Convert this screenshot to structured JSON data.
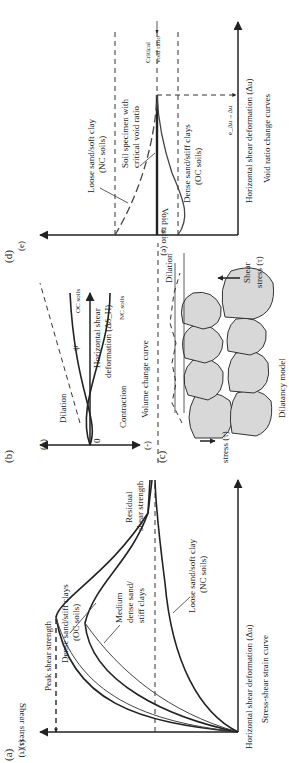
{
  "figure": {
    "orientation": "rotated 90 degrees counter-clockwise",
    "panels": {
      "a": {
        "tag": "(a)",
        "y_axis_symbol": "(τ)",
        "y_axis_label": "Shear stress (τ)",
        "x_axis_label": "Horizontal shear deformation (Δu)",
        "caption": "Stress-shear strain curve",
        "annotations": {
          "peak": "Peak shear strength",
          "dense": [
            "Dense sand/stiff clays",
            "(OC soils)"
          ],
          "medium": [
            "Medium",
            "dense sand/",
            "stiff clays"
          ],
          "loose": [
            "Loose sand/soft clay",
            "(NC soils)"
          ],
          "residual": [
            "Residual",
            "shear strength"
          ]
        }
      },
      "b": {
        "tag": "(b)",
        "plus": "(+)",
        "minus": "(-)",
        "zero": "0",
        "dilation": "Dilation",
        "contraction": "Contraction",
        "psi": "ψ",
        "oc": "OC soils",
        "nc": "NC soils",
        "x_axis_label": [
          "Horizontal shear",
          "deformation (Δδ_H)"
        ],
        "caption": "Volume change curve"
      },
      "c": {
        "tag": "(c)",
        "dilation": "Dilation",
        "shear_stress_top": [
          "Shear",
          "stress (τ)"
        ],
        "shear_stress_bottom": "stress (τ)",
        "caption": "Dilatancy model"
      },
      "d": {
        "tag": "(d)",
        "y_axis_symbol": "(e)",
        "y_axis_label": "Void ratio (e)",
        "x_axis_label": "Horizontal shear deformation (Δu)",
        "caption": "Void ratio change curves",
        "e0": "e",
        "ecrit": "e_Δu→Δu",
        "annotations": {
          "loose": [
            "Loose sand/soft clay",
            "(NC soils)"
          ],
          "critical_specimen": [
            "Soil specimen with",
            "critical void ratio"
          ],
          "dense": [
            "Dense sand/stiff clays",
            "(OC soils)"
          ],
          "critical_void": [
            "Critical",
            "void ratio"
          ]
        }
      }
    }
  }
}
